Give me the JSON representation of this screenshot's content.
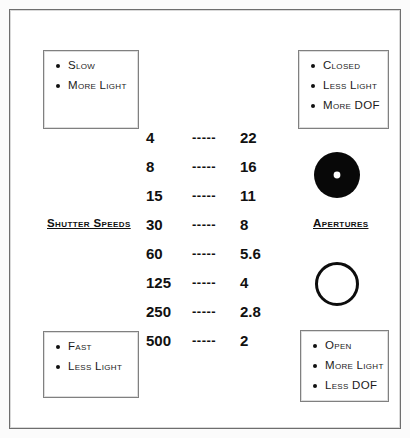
{
  "diagram": {
    "colors": {
      "ink": "#111111",
      "frame_border": "#6e6e6e",
      "box_border": "#808080",
      "background": "#ffffff"
    },
    "sections": {
      "shutter_label": "Shutter Speeds",
      "aperture_label": "Apertures"
    },
    "callouts": {
      "top_left": {
        "name": "slow-shutter-effects",
        "items": [
          "Slow",
          "More Light"
        ]
      },
      "top_right": {
        "name": "closed-aperture-effects",
        "items": [
          "Closed",
          "Less Light",
          "More DOF"
        ]
      },
      "bottom_left": {
        "name": "fast-shutter-effects",
        "items": [
          "Fast",
          "Less Light"
        ]
      },
      "bottom_right": {
        "name": "open-aperture-effects",
        "items": [
          "Open",
          "More Light",
          "Less DOF"
        ]
      }
    },
    "separator": "-----",
    "pairs": [
      {
        "shutter_speed": "4",
        "aperture": "22"
      },
      {
        "shutter_speed": "8",
        "aperture": "16"
      },
      {
        "shutter_speed": "15",
        "aperture": "11"
      },
      {
        "shutter_speed": "30",
        "aperture": "8"
      },
      {
        "shutter_speed": "60",
        "aperture": "5.6"
      },
      {
        "shutter_speed": "125",
        "aperture": "4"
      },
      {
        "shutter_speed": "250",
        "aperture": "2.8"
      },
      {
        "shutter_speed": "500",
        "aperture": "2"
      }
    ],
    "glyphs": {
      "closed_aperture": "closed-aperture-icon",
      "open_aperture": "open-aperture-icon"
    }
  }
}
